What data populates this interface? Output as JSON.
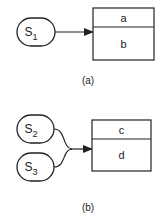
{
  "diagram_a": {
    "caption": "(a)",
    "sources": [
      {
        "base": "S",
        "sub": "1"
      }
    ],
    "record": {
      "fields": [
        "a",
        "b"
      ]
    }
  },
  "diagram_b": {
    "caption": "(b)",
    "sources": [
      {
        "base": "S",
        "sub": "2"
      },
      {
        "base": "S",
        "sub": "3"
      }
    ],
    "record": {
      "fields": [
        "c",
        "d"
      ]
    }
  },
  "colors": {
    "stroke": "#222222",
    "background": "#ffffff"
  }
}
